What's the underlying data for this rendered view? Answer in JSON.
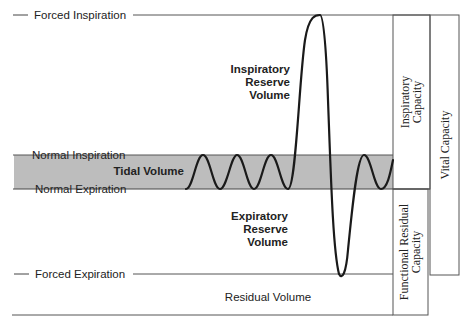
{
  "diagram": {
    "levels": {
      "forced_inspiration": "Forced Inspiration",
      "normal_inspiration": "Normal Inspiration",
      "normal_expiration": "Normal Expiration",
      "forced_expiration": "Forced Expiration"
    },
    "volumes": {
      "tidal": "Tidal Volume",
      "irv_line1": "Inspiratory",
      "irv_line2": "Reserve",
      "irv_line3": "Volume",
      "erv_line1": "Expiratory",
      "erv_line2": "Reserve",
      "erv_line3": "Volume",
      "residual": "Residual Volume"
    },
    "capacities": {
      "ic_line1": "Inspiratory",
      "ic_line2": "Capacity",
      "frc_line1": "Functional Residual",
      "frc_line2": "Capacity",
      "vc": "Vital Capacity"
    },
    "colors": {
      "tidal_band": "#b8b8b8",
      "line": "#333333",
      "trace": "#1a1a1a"
    }
  }
}
